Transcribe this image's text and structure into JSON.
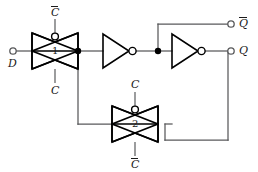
{
  "diagram": {
    "colors": {
      "wire": "#58595b",
      "device": "#000000",
      "text": "#1a1a1a",
      "background": "#ffffff"
    },
    "terminals": {
      "data_input": "D",
      "output_q": "Q",
      "output_qbar": "Q"
    },
    "gate1": {
      "number": "1",
      "top_control": "C",
      "bottom_control": "C"
    },
    "gate2": {
      "number": "2",
      "top_control": "C",
      "bottom_control": "C"
    },
    "inverters": {
      "first": "inverter-1",
      "second": "inverter-2"
    }
  }
}
